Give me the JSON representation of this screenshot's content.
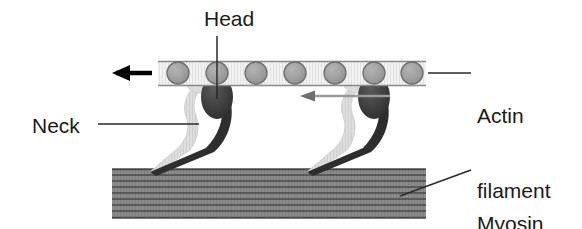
{
  "diagram": {
    "type": "biological-schematic",
    "labels": {
      "head": "Head",
      "neck": "Neck",
      "actin_filament_line1": "Actin",
      "actin_filament_line2": "filament",
      "myosin_filament_line1": "Myosin",
      "myosin_filament_line2": "filament"
    },
    "colors": {
      "background": "#ffffff",
      "text": "#1a1a1a",
      "actin_band_fill": "#efefef",
      "actin_band_stroke": "#8a8a8a",
      "actin_subunit_fill": "#9a9a9a",
      "actin_subunit_stroke": "#6e6e6e",
      "myosin_head_dark": "#3a3a3a",
      "myosin_neck_dark": "#2e2e2e",
      "ghost_gray": "#d8d8d8",
      "myosin_filament_fill": "#8c8c8c",
      "myosin_filament_stripe": "#4a4a4a",
      "arrow_black": "#000000",
      "arrow_gray": "#9a9a9a",
      "leader_line": "#3a3a3a"
    },
    "actin": {
      "subunit_count": 7,
      "subunit_radius": 11,
      "subunit_centers_x": [
        178,
        217,
        256,
        295,
        335,
        374,
        412
      ],
      "subunit_center_y": 73,
      "band_left": 158,
      "band_right": 426,
      "band_top": 61,
      "band_bottom": 86
    },
    "myosin_filament": {
      "left": 112,
      "right": 426,
      "top": 168,
      "bottom": 219,
      "stripe_count": 9
    },
    "cross_bridges": [
      {
        "head_center_x": 217,
        "head_center_y": 97,
        "anchor_x": 150,
        "anchor_y": 172
      },
      {
        "head_center_x": 374,
        "head_center_y": 97,
        "anchor_x": 307,
        "anchor_y": 172
      }
    ],
    "arrows": {
      "sliding_direction": {
        "label_semantic": "filament-sliding-direction",
        "from_x": 152,
        "from_y": 73,
        "to_x": 98,
        "to_y": 73,
        "direction": "left",
        "style": "thick-black"
      },
      "power_stroke": {
        "label_semantic": "power-stroke-direction",
        "from_x": 388,
        "from_y": 96,
        "to_x": 300,
        "to_y": 96,
        "direction": "left",
        "style": "thin-gray"
      }
    },
    "leaders": {
      "head": {
        "x": 217,
        "y1": 36,
        "y2": 99,
        "orientation": "vertical"
      },
      "neck": {
        "x1": 98,
        "y1": 124,
        "x2": 196,
        "y2": 124,
        "orientation": "horizontal"
      },
      "actin": {
        "x1": 428,
        "y1": 73,
        "x2": 470,
        "y2": 73,
        "orientation": "horizontal"
      },
      "myosin": {
        "x1": 402,
        "y1": 195,
        "x2": 470,
        "y2": 170,
        "orientation": "diagonal"
      }
    }
  }
}
